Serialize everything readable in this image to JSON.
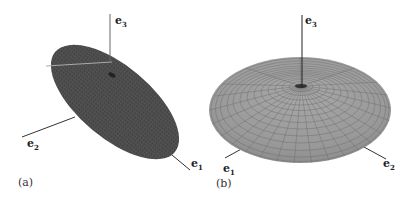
{
  "figure": {
    "panels": [
      {
        "id": "a",
        "caption": "(a)",
        "shape": "flat tilted ellipse (disk)",
        "fill_color": "#4a4a4a",
        "axes": [
          {
            "vector": "e",
            "index": "3"
          },
          {
            "vector": "e",
            "index": "2"
          },
          {
            "vector": "e",
            "index": "1"
          }
        ]
      },
      {
        "id": "b",
        "caption": "(b)",
        "shape": "oblate spheroid with mesh",
        "fill_color": "#9a9a9a",
        "mesh_color": "#6e6e6e",
        "axes": [
          {
            "vector": "e",
            "index": "3"
          },
          {
            "vector": "e",
            "index": "1"
          },
          {
            "vector": "e",
            "index": "2"
          }
        ]
      }
    ]
  }
}
